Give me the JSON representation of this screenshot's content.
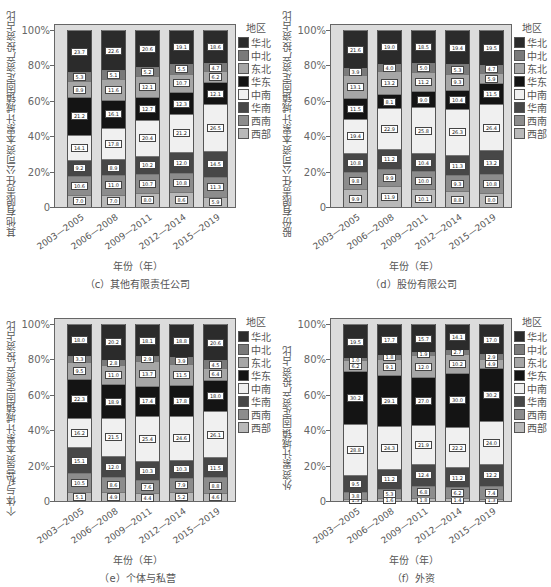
{
  "legend_title": "地区",
  "regions": [
    "西部",
    "西南",
    "华南",
    "中南",
    "华东",
    "东北",
    "中北",
    "华北"
  ],
  "legend_order": [
    "华北",
    "中北",
    "东北",
    "华东",
    "中南",
    "华南",
    "西南",
    "西部"
  ],
  "colors": {
    "西部": "#b9b9b9",
    "西南": "#8c8c8c",
    "华南": "#474747",
    "中南": "#f0f0f0",
    "华东": "#141414",
    "东北": "#a6a6a6",
    "中北": "#7a7a7a",
    "华北": "#2b2b2b"
  },
  "y_ticks": [
    "0",
    "20%",
    "40%",
    "60%",
    "80%",
    "100%"
  ],
  "x_title": "年份（年）",
  "chart_data": [
    {
      "type": "bar",
      "stacked": true,
      "title": "（c）其他有限责任公司",
      "xlabel": "年份（年）",
      "ylabel": "其他有限责任公司资本累计城镇固定资产投资占比",
      "categories": [
        "2003—2005",
        "2006—2008",
        "2009—2011",
        "2012—2014",
        "2015—2019"
      ],
      "ylim": [
        0,
        100
      ],
      "legend_position": "right",
      "series": [
        {
          "name": "西部",
          "values": [
            7.0,
            7.0,
            8.0,
            8.6,
            5.9
          ]
        },
        {
          "name": "西南",
          "values": [
            10.6,
            11.0,
            10.7,
            10.8,
            11.3
          ]
        },
        {
          "name": "华南",
          "values": [
            9.2,
            8.9,
            10.2,
            12.0,
            14.5
          ]
        },
        {
          "name": "中南",
          "values": [
            14.1,
            17.8,
            20.4,
            21.2,
            26.5
          ]
        },
        {
          "name": "华东",
          "values": [
            21.2,
            16.1,
            12.7,
            12.3,
            12.1
          ]
        },
        {
          "name": "东北",
          "values": [
            8.9,
            11.6,
            12.1,
            10.7,
            6.2
          ]
        },
        {
          "name": "中北",
          "values": [
            5.3,
            5.1,
            5.2,
            5.5,
            4.7
          ]
        },
        {
          "name": "华北",
          "values": [
            23.7,
            22.6,
            20.6,
            19.1,
            18.6
          ]
        }
      ]
    },
    {
      "type": "bar",
      "stacked": true,
      "title": "（d）股份有限公司",
      "xlabel": "年份（年）",
      "ylabel": "股份有限责任公司资本累计城镇固定资产投资占比",
      "categories": [
        "2003—2005",
        "2006—2008",
        "2009—2011",
        "2012—2014",
        "2015—2019"
      ],
      "ylim": [
        0,
        100
      ],
      "legend_position": "right",
      "series": [
        {
          "name": "西部",
          "values": [
            9.9,
            11.9,
            10.1,
            8.8,
            8.0
          ]
        },
        {
          "name": "西南",
          "values": [
            9.8,
            9.9,
            10.0,
            9.3,
            10.8
          ]
        },
        {
          "name": "华南",
          "values": [
            10.8,
            11.2,
            10.4,
            11.3,
            13.2
          ]
        },
        {
          "name": "中南",
          "values": [
            19.4,
            22.9,
            25.8,
            26.3,
            26.4
          ]
        },
        {
          "name": "华东",
          "values": [
            11.5,
            8.1,
            9.0,
            10.4,
            11.5
          ]
        },
        {
          "name": "东北",
          "values": [
            13.1,
            13.2,
            11.2,
            9.3,
            5.9
          ]
        },
        {
          "name": "中北",
          "values": [
            3.9,
            4.0,
            5.0,
            5.3,
            4.7
          ]
        },
        {
          "name": "华北",
          "values": [
            21.6,
            19.0,
            18.5,
            19.4,
            19.5
          ]
        }
      ]
    },
    {
      "type": "bar",
      "stacked": true,
      "title": "（e）个体与私营",
      "xlabel": "年份（年）",
      "ylabel": "个体与私营资本累计城镇固定资产投资占比",
      "categories": [
        "2003—2005",
        "2006—2008",
        "2009—2011",
        "2012—2014",
        "2015—2019"
      ],
      "ylim": [
        0,
        100
      ],
      "legend_position": "right",
      "series": [
        {
          "name": "西部",
          "values": [
            5.1,
            4.9,
            4.4,
            5.2,
            4.6
          ]
        },
        {
          "name": "西南",
          "values": [
            10.5,
            8.6,
            7.6,
            7.9,
            8.8
          ]
        },
        {
          "name": "华南",
          "values": [
            15.1,
            12.0,
            10.3,
            10.3,
            11.5
          ]
        },
        {
          "name": "中南",
          "values": [
            16.2,
            21.5,
            25.4,
            24.6,
            26.1
          ]
        },
        {
          "name": "华东",
          "values": [
            22.3,
            18.9,
            17.4,
            17.8,
            18.0
          ]
        },
        {
          "name": "东北",
          "values": [
            9.5,
            11.0,
            13.7,
            11.5,
            6.4
          ]
        },
        {
          "name": "中北",
          "values": [
            3.3,
            2.8,
            2.9,
            3.9,
            4.5
          ]
        },
        {
          "name": "华北",
          "values": [
            18.0,
            20.2,
            18.1,
            18.8,
            20.6
          ]
        }
      ]
    },
    {
      "type": "bar",
      "stacked": true,
      "title": "（f）外资",
      "xlabel": "年份（年）",
      "ylabel": "外资累计城镇固定资产投资占比",
      "categories": [
        "2003—2005",
        "2006—2008",
        "2009—2011",
        "2012—2014",
        "2015—2019"
      ],
      "ylim": [
        0,
        100
      ],
      "legend_position": "right",
      "series": [
        {
          "name": "西部",
          "values": [
            1.3,
            1.6,
            1.8,
            1.4,
            1.3
          ]
        },
        {
          "name": "西南",
          "values": [
            3.8,
            5.3,
            6.8,
            6.2,
            7.4
          ]
        },
        {
          "name": "华南",
          "values": [
            9.5,
            11.2,
            12.4,
            11.2,
            12.2
          ]
        },
        {
          "name": "中南",
          "values": [
            28.8,
            24.3,
            21.9,
            22.2,
            24.0
          ]
        },
        {
          "name": "华东",
          "values": [
            30.2,
            29.1,
            27.0,
            30.0,
            30.2
          ]
        },
        {
          "name": "东北",
          "values": [
            6.2,
            9.1,
            12.0,
            10.2,
            4.9
          ]
        },
        {
          "name": "中北",
          "values": [
            1.0,
            1.8,
            1.9,
            2.7,
            2.9
          ]
        },
        {
          "name": "华北",
          "values": [
            19.5,
            17.7,
            15.7,
            14.1,
            17.0
          ]
        }
      ]
    }
  ]
}
